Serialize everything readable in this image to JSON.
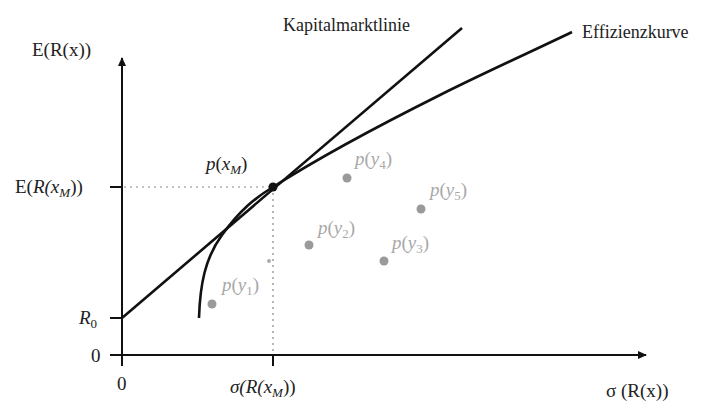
{
  "diagram": {
    "type": "capital-market-line",
    "y_axis_label": "E(R(x))",
    "x_axis_label": "σ (R(x))",
    "y_ticks": {
      "zero": "0",
      "r0": {
        "main": "R",
        "sub": "0"
      },
      "expected_market": {
        "pre": "E(",
        "R": "R",
        "x": "(x",
        "sub": "M",
        "post": "))"
      }
    },
    "x_ticks": {
      "zero": "0",
      "sigma_market": {
        "pre": "σ(",
        "R": "R",
        "x": "(x",
        "sub": "M",
        "post": "))"
      }
    },
    "curves": {
      "capital_market_line": "Kapitalmarktlinie",
      "efficient_frontier": "Effizienzkurve"
    },
    "market_portfolio": {
      "p": "p",
      "open": "(x",
      "sub": "M",
      "close": ")"
    },
    "portfolios": [
      {
        "p": "p",
        "open": "(y",
        "sub": "1",
        "close": ")"
      },
      {
        "p": "p",
        "open": "(y",
        "sub": "2",
        "close": ")"
      },
      {
        "p": "p",
        "open": "(y",
        "sub": "3",
        "close": ")"
      },
      {
        "p": "p",
        "open": "(y",
        "sub": "4",
        "close": ")"
      },
      {
        "p": "p",
        "open": "(y",
        "sub": "5",
        "close": ")"
      }
    ],
    "colors": {
      "line": "#111111",
      "points": "#9a9a9a",
      "labels_gray": "#a8a8a8",
      "guides": "#888888"
    }
  }
}
